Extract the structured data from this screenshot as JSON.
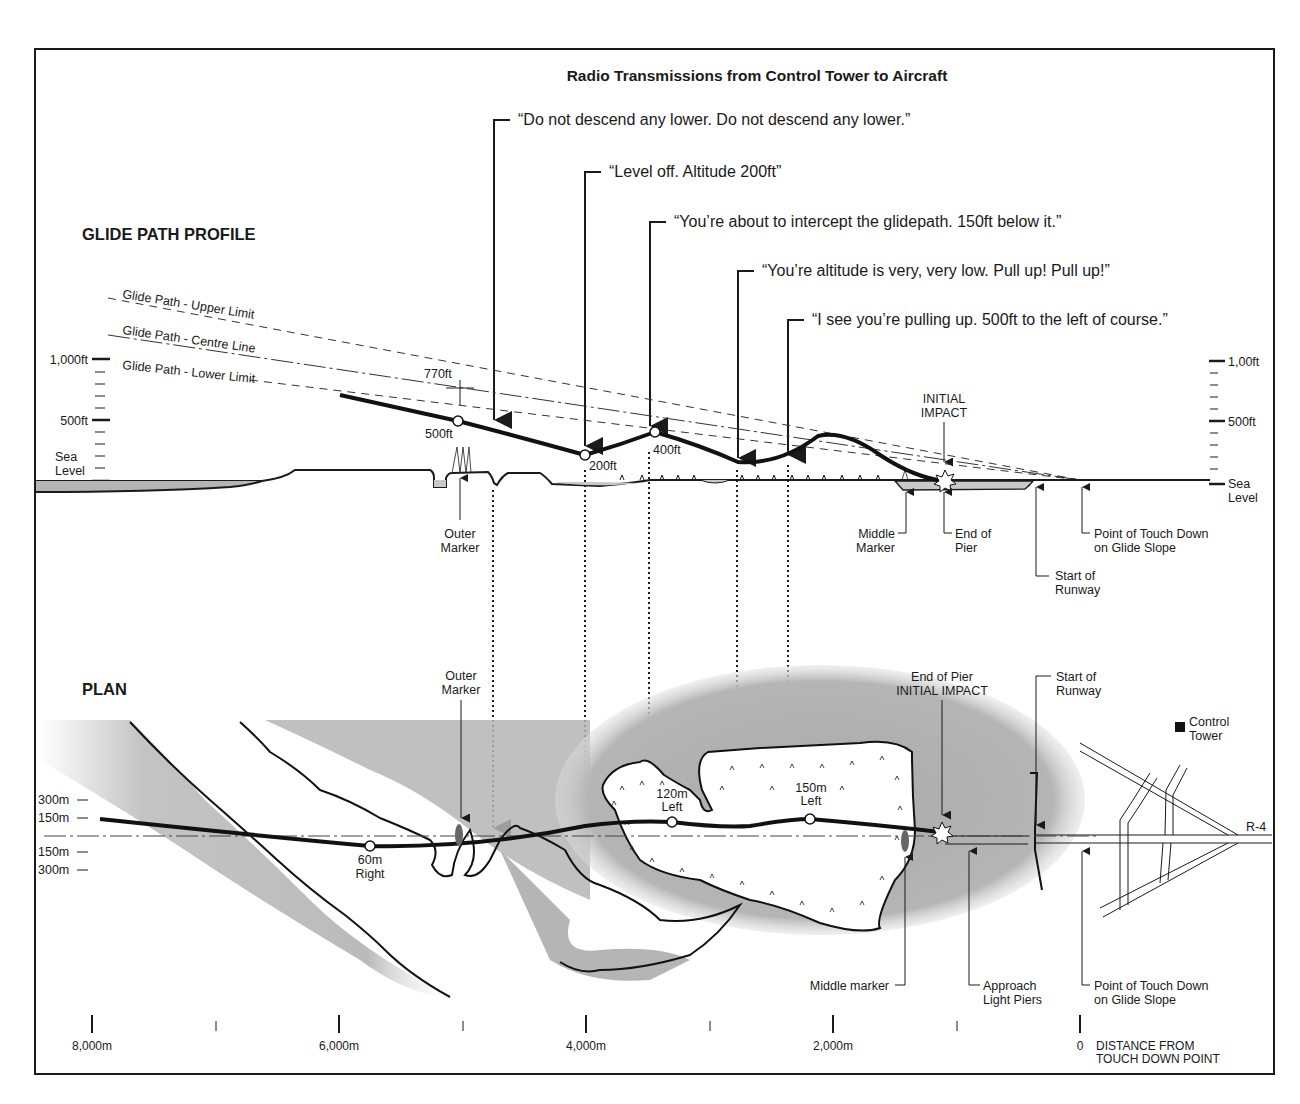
{
  "title": "Radio Transmissions from Control Tower to Aircraft",
  "sections": {
    "profile": "GLIDE PATH PROFILE",
    "plan": "PLAN"
  },
  "transmissions": [
    {
      "text": "“Do not descend any lower. Do not descend any lower.”",
      "x": 494,
      "y": 120
    },
    {
      "text": "“Level off. Altitude 200ft”",
      "x": 585,
      "y": 172
    },
    {
      "text": "“You’re about to intercept the glidepath. 150ft below it.”",
      "x": 650,
      "y": 222
    },
    {
      "text": "“You’re altitude is very, very low. Pull up! Pull up!”",
      "x": 738,
      "y": 271
    },
    {
      "text": "“I see you’re pulling up. 500ft to the left of course.”",
      "x": 788,
      "y": 320
    }
  ],
  "glide_path_labels": {
    "upper": "Glide Path - Upper Limit",
    "centre": "Glide Path - Centre Line",
    "lower": "Glide Path - Lower Limit"
  },
  "profile_axis_left": {
    "ticks": [
      "1,000ft",
      "500ft",
      "Sea",
      "Level"
    ]
  },
  "profile_axis_right": {
    "ticks": [
      "1,00ft",
      "500ft",
      "Sea",
      "Level"
    ]
  },
  "profile_points": {
    "p770": "770ft",
    "p500": "500ft",
    "p200": "200ft",
    "p400": "400ft"
  },
  "profile_annotations": {
    "outer_marker": [
      "Outer",
      "Marker"
    ],
    "initial_impact": [
      "INITIAL",
      "IMPACT"
    ],
    "middle_marker": [
      "Middle",
      "Marker"
    ],
    "end_of_pier": [
      "End of",
      "Pier"
    ],
    "touch_down": [
      "Point of Touch Down",
      "on Glide Slope"
    ],
    "start_runway": [
      "Start of",
      "Runway"
    ]
  },
  "plan_axis": {
    "ticks": [
      "300m",
      "150m",
      "150m",
      "300m"
    ]
  },
  "plan_points": {
    "right60": [
      "60m",
      "Right"
    ],
    "left120": [
      "120m",
      "Left"
    ],
    "left150": [
      "150m",
      "Left"
    ]
  },
  "plan_annotations": {
    "outer_marker": [
      "Outer",
      "Marker"
    ],
    "end_of_pier": [
      "End of Pier",
      "INITIAL IMPACT"
    ],
    "start_runway": [
      "Start of",
      "Runway"
    ],
    "control_tower": [
      "Control",
      "Tower"
    ],
    "runway_label": "R-4",
    "middle_marker": "Middle marker",
    "approach_piers": [
      "Approach",
      "Light Piers"
    ],
    "touch_down": [
      "Point of Touch Down",
      "on Glide Slope"
    ]
  },
  "distance_axis": {
    "ticks": [
      "8,000m",
      "6,000m",
      "4,000m",
      "2,000m",
      "0"
    ],
    "caption": [
      "DISTANCE FROM",
      "TOUCH DOWN POINT"
    ]
  },
  "colors": {
    "ink": "#1a1a1a",
    "water": "#b8b8b8",
    "water_light": "#d9d9d9",
    "paper": "#ffffff"
  }
}
